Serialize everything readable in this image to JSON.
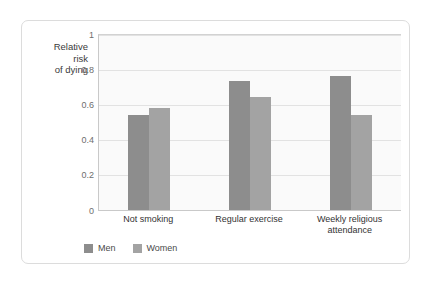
{
  "chart_data": {
    "type": "bar",
    "title": "",
    "subtitle": "",
    "xlabel": "",
    "ylabel": "Relative\nrisk\nof dying",
    "categories": [
      "Not smoking",
      "Regular exercise",
      "Weekly religious\nattendance"
    ],
    "series": [
      {
        "name": "Men",
        "values": [
          0.545,
          0.735,
          0.765
        ],
        "color": "#8d8d8d"
      },
      {
        "name": "Women",
        "values": [
          0.585,
          0.645,
          0.545
        ],
        "color": "#a3a3a3"
      }
    ],
    "ylim": [
      0,
      1
    ],
    "yticks": [
      0,
      0.2,
      0.4,
      0.6,
      0.8,
      1
    ],
    "ytick_labels": [
      "0",
      "0.2",
      "0.4",
      "0.6",
      "0.8",
      "1"
    ],
    "grid": "horizontal",
    "legend_position": "bottom-left",
    "annotations": []
  },
  "legend": {
    "entries": [
      {
        "label": "Men"
      },
      {
        "label": "Women"
      }
    ]
  },
  "colors": {
    "men": "#8d8d8d",
    "women": "#a3a3a3",
    "plot_background": "#fafafa",
    "gridline": "#e2e2e2",
    "card_border": "#dcdcdc"
  }
}
